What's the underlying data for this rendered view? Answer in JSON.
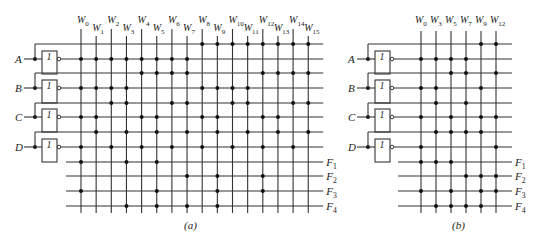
{
  "figure": {
    "colors": {
      "line": "#333333",
      "dot": "#111111",
      "background": "#ffffff"
    },
    "panels": [
      {
        "id": "a",
        "caption": "(a)",
        "inputs": [
          "A",
          "B",
          "C",
          "D"
        ],
        "inverter_label": "1",
        "columns": [
          "W0",
          "W1",
          "W2",
          "W3",
          "W4",
          "W5",
          "W6",
          "W7",
          "W8",
          "W9",
          "W10",
          "W11",
          "W12",
          "W13",
          "W14",
          "W15"
        ],
        "column_indices": [
          0,
          1,
          2,
          3,
          4,
          5,
          6,
          7,
          8,
          9,
          10,
          11,
          12,
          13,
          14,
          15
        ],
        "outputs": [
          "F1",
          "F2",
          "F3",
          "F4"
        ],
        "output_connections": {
          "F1": [
            0,
            3,
            5
          ],
          "F2": [
            7,
            9,
            12
          ],
          "F3": [
            0,
            5,
            9,
            12
          ],
          "F4": [
            3,
            5,
            7,
            9
          ]
        }
      },
      {
        "id": "b",
        "caption": "(b)",
        "inputs": [
          "A",
          "B",
          "C",
          "D"
        ],
        "inverter_label": "1",
        "columns": [
          "W0",
          "W3",
          "W5",
          "W7",
          "W9",
          "W12"
        ],
        "column_indices": [
          0,
          3,
          5,
          7,
          9,
          12
        ],
        "outputs": [
          "F1",
          "F2",
          "F3",
          "F4"
        ],
        "output_connections": {
          "F1": [
            0,
            3,
            5
          ],
          "F2": [
            7,
            9,
            12
          ],
          "F3": [
            0,
            5,
            9,
            12
          ],
          "F4": [
            3,
            5,
            7,
            9
          ]
        }
      }
    ]
  }
}
